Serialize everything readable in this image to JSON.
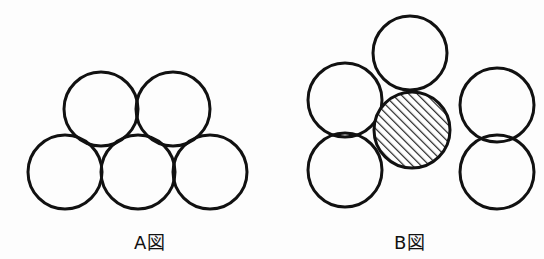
{
  "figures": [
    {
      "id": "A",
      "label": "A図",
      "circles": [
        {
          "cx": 65,
          "cy": 172,
          "r": 37,
          "fill": "none"
        },
        {
          "cx": 138,
          "cy": 172,
          "r": 37,
          "fill": "none"
        },
        {
          "cx": 210,
          "cy": 172,
          "r": 37,
          "fill": "none"
        },
        {
          "cx": 101,
          "cy": 109,
          "r": 37,
          "fill": "none"
        },
        {
          "cx": 173,
          "cy": 109,
          "r": 37,
          "fill": "none"
        }
      ]
    },
    {
      "id": "B",
      "label": "B図",
      "circles": [
        {
          "cx": 410,
          "cy": 53,
          "r": 37,
          "fill": "none"
        },
        {
          "cx": 345,
          "cy": 100,
          "r": 37,
          "fill": "none"
        },
        {
          "cx": 497,
          "cy": 105,
          "r": 37,
          "fill": "none"
        },
        {
          "cx": 345,
          "cy": 170,
          "r": 37,
          "fill": "none"
        },
        {
          "cx": 497,
          "cy": 172,
          "r": 37,
          "fill": "none"
        },
        {
          "cx": 412,
          "cy": 130,
          "r": 38,
          "fill": "hatched"
        }
      ]
    }
  ],
  "style": {
    "stroke": "#111111",
    "stroke_width": 3,
    "hatch_color": "#222222"
  }
}
